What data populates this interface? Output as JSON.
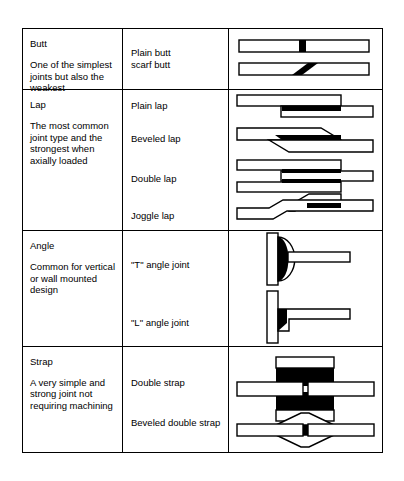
{
  "document": {
    "type": "adhesive-joint-types-table",
    "columns": [
      "category",
      "joint_names",
      "figures"
    ],
    "border_color": "#000000",
    "background_color": "#ffffff",
    "fill_colors": {
      "adherend": "#ffffff",
      "adhesive": "#000000",
      "outline": "#000000"
    }
  },
  "rows": [
    {
      "category": "Butt",
      "description": "One of the simplest joints but also the weakest",
      "joints": [
        {
          "name": "Plain butt",
          "figure": "plain-butt-figure"
        },
        {
          "name": "scarf butt",
          "figure": "scarf-butt-figure"
        }
      ]
    },
    {
      "category": "Lap",
      "description": "The most common joint type and the strongest when axially loaded",
      "joints": [
        {
          "name": "Plain lap",
          "figure": "plain-lap-figure"
        },
        {
          "name": "Beveled lap",
          "figure": "beveled-lap-figure"
        },
        {
          "name": "Double lap",
          "figure": "double-lap-figure"
        },
        {
          "name": "Joggle lap",
          "figure": "joggle-lap-figure"
        }
      ]
    },
    {
      "category": "Angle",
      "description": "Common for vertical or wall mounted design",
      "joints": [
        {
          "name": "\"T\" angle joint",
          "figure": "t-angle-joint-figure"
        },
        {
          "name": "\"L\" angle joint",
          "figure": "l-angle-joint-figure"
        }
      ]
    },
    {
      "category": "Strap",
      "description": "A very simple and strong joint not requiring machining",
      "joints": [
        {
          "name": "Double strap",
          "figure": "double-strap-figure"
        },
        {
          "name": "Beveled double strap",
          "figure": "beveled-double-strap-figure"
        }
      ]
    }
  ]
}
